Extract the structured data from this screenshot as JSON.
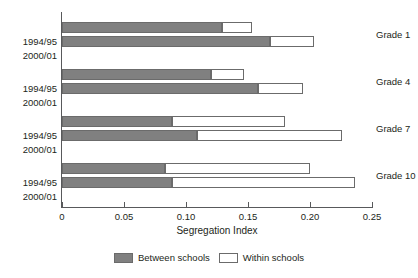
{
  "chart_data": {
    "type": "bar",
    "orientation": "horizontal",
    "stacked": true,
    "title": "",
    "xlabel": "Segregation Index",
    "ylabel": "",
    "xlim": [
      0,
      0.25
    ],
    "xticks": [
      0,
      0.05,
      0.1,
      0.15,
      0.2,
      0.25
    ],
    "xtick_labels": [
      "0",
      "0.05",
      "0.10",
      "0.15",
      "0.20",
      "0.25"
    ],
    "grid": false,
    "legend_position": "bottom-center",
    "groups": [
      "Grade 1",
      "Grade 4",
      "Grade 7",
      "Grade 10"
    ],
    "periods": [
      "1994/95",
      "2000/01"
    ],
    "series": [
      {
        "name": "Between schools",
        "color": "#808080",
        "values": [
          0.129,
          0.168,
          0.12,
          0.158,
          0.089,
          0.109,
          0.083,
          0.089
        ]
      },
      {
        "name": "Within schools",
        "color": "#ffffff",
        "values": [
          0.024,
          0.035,
          0.027,
          0.036,
          0.091,
          0.117,
          0.117,
          0.147
        ]
      }
    ],
    "bars": [
      {
        "group": "Grade 1",
        "period": "1994/95",
        "between": 0.129,
        "within": 0.024,
        "total": 0.153
      },
      {
        "group": "Grade 1",
        "period": "2000/01",
        "between": 0.168,
        "within": 0.035,
        "total": 0.203
      },
      {
        "group": "Grade 4",
        "period": "1994/95",
        "between": 0.12,
        "within": 0.027,
        "total": 0.147
      },
      {
        "group": "Grade 4",
        "period": "2000/01",
        "between": 0.158,
        "within": 0.036,
        "total": 0.194
      },
      {
        "group": "Grade 7",
        "period": "1994/95",
        "between": 0.089,
        "within": 0.091,
        "total": 0.18
      },
      {
        "group": "Grade 7",
        "period": "2000/01",
        "between": 0.109,
        "within": 0.117,
        "total": 0.226
      },
      {
        "group": "Grade 10",
        "period": "1994/95",
        "between": 0.083,
        "within": 0.117,
        "total": 0.2
      },
      {
        "group": "Grade 10",
        "period": "2000/01",
        "between": 0.089,
        "within": 0.147,
        "total": 0.236
      }
    ],
    "legend": [
      {
        "label": "Between schools",
        "swatch": "filled"
      },
      {
        "label": "Within schools",
        "swatch": "hollow"
      }
    ]
  },
  "axis": {
    "x_title": "Segregation Index",
    "tick_labels": [
      "0",
      "0.05",
      "0.10",
      "0.15",
      "0.20",
      "0.25"
    ]
  },
  "period_labels": [
    "1994/95",
    "2000/01",
    "1994/95",
    "2000/01",
    "1994/95",
    "2000/01",
    "1994/95",
    "2000/01"
  ],
  "grade_labels": [
    "Grade 1",
    "Grade 4",
    "Grade 7",
    "Grade 10"
  ],
  "legend": {
    "between_label": "Between schools",
    "within_label": "Within schools"
  },
  "colors": {
    "between": "#808080",
    "within": "#ffffff",
    "axis": "#58595b",
    "text": "#231f20"
  }
}
